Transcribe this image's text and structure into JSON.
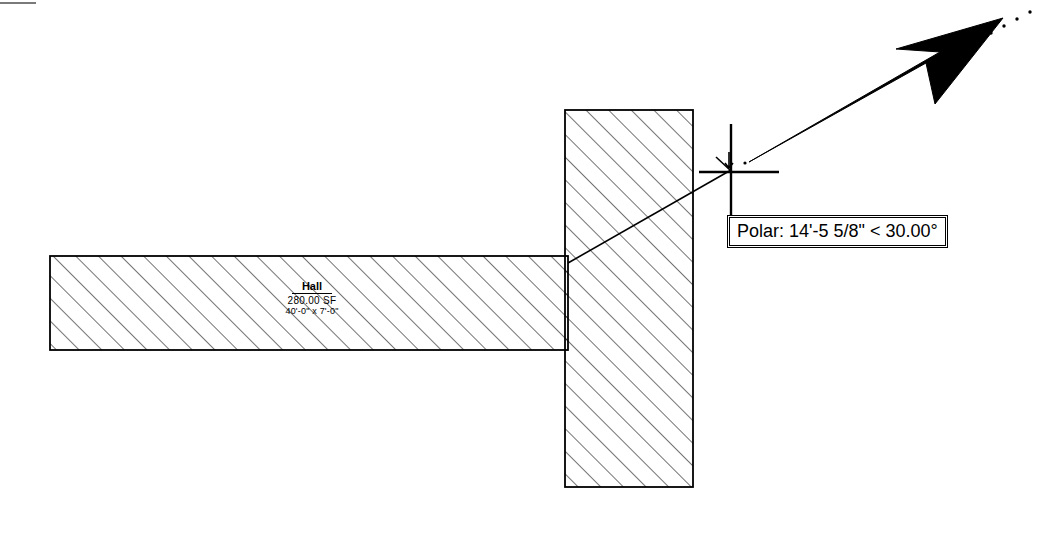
{
  "drawing": {
    "title": "AutoCAD polar tracking drawing",
    "background_color": "#ffffff",
    "line_color": "#000000",
    "hatch_color": "#000000"
  },
  "shapes": {
    "horizontal_beam": {
      "name": "horizontal-wall",
      "x": 50,
      "y": 256,
      "width": 518,
      "height": 94,
      "hatch": "diagonal-45"
    },
    "vertical_column": {
      "name": "vertical-wall",
      "x": 565,
      "y": 110,
      "width": 128,
      "height": 377,
      "hatch": "diagonal-45"
    }
  },
  "room_label": {
    "name": "Hall",
    "area": "280.00 SF",
    "dimensions": "40'-0\" x 7'-0\""
  },
  "tooltip": {
    "text": "Polar: 14'-5 5/8\" < 30.00°",
    "label": "Polar:",
    "distance": "14'-5 5/8\"",
    "comparator": "<",
    "angle": "30.00°"
  },
  "cursor": {
    "crosshair_x": 730,
    "crosshair_y": 172,
    "arrow_label": "mouse-pointer",
    "arrow_tip_x": 1003,
    "arrow_tip_y": 18,
    "tracking_angle_degrees": 30
  },
  "rubber_band": {
    "start_x": 568,
    "start_y": 262,
    "end_x": 730,
    "end_y": 170
  },
  "tracking_line": {
    "dotted": true,
    "start_x": 940,
    "start_y": 60,
    "end_x": 1030,
    "end_y": 10
  }
}
